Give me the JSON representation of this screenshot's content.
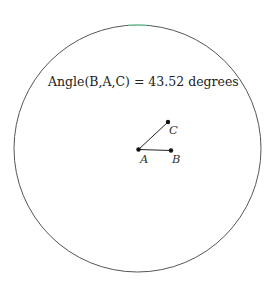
{
  "diagram": {
    "circle": {
      "cx": 137.5,
      "cy": 148.5,
      "r": 123.5,
      "stroke": "#555555",
      "accent": "#7fd9a8"
    },
    "annotation": "Angle(B,A,C) = 43.52 degrees",
    "points": [
      {
        "name": "A",
        "x": 138.5,
        "y": 149.5
      },
      {
        "name": "B",
        "x": 171,
        "y": 150.5
      },
      {
        "name": "C",
        "x": 168,
        "y": 122
      }
    ],
    "segments": [
      [
        "A",
        "B"
      ],
      [
        "A",
        "C"
      ]
    ],
    "labels": {
      "A": "A",
      "B": "B",
      "C": "C"
    }
  }
}
